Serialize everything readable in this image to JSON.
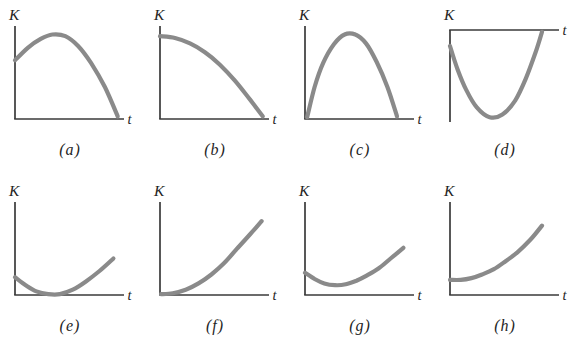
{
  "figure": {
    "name": "eight-kinetic-energy-versus-time-graphs",
    "background_color": "#ffffff",
    "curve_color": "#8a8a8a",
    "axis_color": "#3a3a3a",
    "text_color": "#1f1f1f",
    "curve_stroke_width": 4.2,
    "axis_stroke_width": 1.7
  },
  "chart_data": [
    {
      "id": "a",
      "type": "line",
      "caption": "(a)",
      "xlabel": "t",
      "ylabel": "K",
      "x_axis_position": "bottom",
      "x_range": [
        0,
        1
      ],
      "y_range": [
        0,
        1
      ],
      "grid": false,
      "points": [
        [
          0,
          0.66
        ],
        [
          0.12,
          0.8
        ],
        [
          0.24,
          0.9
        ],
        [
          0.35,
          0.95
        ],
        [
          0.47,
          0.93
        ],
        [
          0.59,
          0.82
        ],
        [
          0.71,
          0.63
        ],
        [
          0.84,
          0.36
        ],
        [
          0.96,
          0.03
        ]
      ]
    },
    {
      "id": "b",
      "type": "line",
      "caption": "(b)",
      "xlabel": "t",
      "ylabel": "K",
      "x_axis_position": "bottom",
      "x_range": [
        0,
        1
      ],
      "y_range": [
        0,
        1
      ],
      "grid": false,
      "points": [
        [
          0,
          0.93
        ],
        [
          0.14,
          0.91
        ],
        [
          0.28,
          0.85
        ],
        [
          0.42,
          0.75
        ],
        [
          0.56,
          0.61
        ],
        [
          0.7,
          0.43
        ],
        [
          0.84,
          0.22
        ],
        [
          0.96,
          0.03
        ]
      ]
    },
    {
      "id": "c",
      "type": "line",
      "caption": "(c)",
      "xlabel": "t",
      "ylabel": "K",
      "x_axis_position": "bottom",
      "x_range": [
        0,
        1
      ],
      "y_range": [
        0,
        1
      ],
      "grid": false,
      "points": [
        [
          0.02,
          0.02
        ],
        [
          0.09,
          0.36
        ],
        [
          0.17,
          0.63
        ],
        [
          0.27,
          0.84
        ],
        [
          0.37,
          0.95
        ],
        [
          0.47,
          0.95
        ],
        [
          0.57,
          0.85
        ],
        [
          0.67,
          0.64
        ],
        [
          0.77,
          0.36
        ],
        [
          0.86,
          0.03
        ]
      ]
    },
    {
      "id": "d",
      "type": "line",
      "caption": "(d)",
      "xlabel": "t",
      "ylabel": "K",
      "x_axis_position": "top",
      "x_range": [
        0,
        1
      ],
      "y_range": [
        0,
        1
      ],
      "grid": false,
      "points": [
        [
          0,
          0.18
        ],
        [
          0.07,
          0.44
        ],
        [
          0.15,
          0.67
        ],
        [
          0.25,
          0.87
        ],
        [
          0.37,
          0.98
        ],
        [
          0.49,
          0.95
        ],
        [
          0.61,
          0.79
        ],
        [
          0.71,
          0.54
        ],
        [
          0.8,
          0.25
        ],
        [
          0.86,
          0.02
        ]
      ]
    },
    {
      "id": "e",
      "type": "line",
      "caption": "(e)",
      "xlabel": "t",
      "ylabel": "K",
      "x_axis_position": "bottom",
      "x_range": [
        0,
        1
      ],
      "y_range": [
        0,
        1
      ],
      "grid": false,
      "points": [
        [
          0,
          0.2
        ],
        [
          0.1,
          0.11
        ],
        [
          0.2,
          0.04
        ],
        [
          0.31,
          0.01
        ],
        [
          0.42,
          0.01
        ],
        [
          0.54,
          0.06
        ],
        [
          0.66,
          0.15
        ],
        [
          0.79,
          0.27
        ],
        [
          0.92,
          0.41
        ]
      ]
    },
    {
      "id": "f",
      "type": "line",
      "caption": "(f)",
      "xlabel": "t",
      "ylabel": "K",
      "x_axis_position": "bottom",
      "x_range": [
        0,
        1
      ],
      "y_range": [
        0,
        1
      ],
      "grid": false,
      "points": [
        [
          0.01,
          0.01
        ],
        [
          0.12,
          0.02
        ],
        [
          0.24,
          0.06
        ],
        [
          0.36,
          0.13
        ],
        [
          0.48,
          0.23
        ],
        [
          0.6,
          0.36
        ],
        [
          0.72,
          0.52
        ],
        [
          0.84,
          0.68
        ],
        [
          0.95,
          0.83
        ]
      ]
    },
    {
      "id": "g",
      "type": "line",
      "caption": "(g)",
      "xlabel": "t",
      "ylabel": "K",
      "x_axis_position": "bottom",
      "x_range": [
        0,
        1
      ],
      "y_range": [
        0,
        1
      ],
      "grid": false,
      "points": [
        [
          0,
          0.25
        ],
        [
          0.09,
          0.18
        ],
        [
          0.18,
          0.13
        ],
        [
          0.28,
          0.11
        ],
        [
          0.38,
          0.12
        ],
        [
          0.48,
          0.16
        ],
        [
          0.58,
          0.22
        ],
        [
          0.69,
          0.3
        ],
        [
          0.8,
          0.41
        ],
        [
          0.92,
          0.53
        ]
      ]
    },
    {
      "id": "h",
      "type": "line",
      "caption": "(h)",
      "xlabel": "t",
      "ylabel": "K",
      "x_axis_position": "bottom",
      "x_range": [
        0,
        1
      ],
      "y_range": [
        0,
        1
      ],
      "grid": false,
      "points": [
        [
          0,
          0.17
        ],
        [
          0.1,
          0.17
        ],
        [
          0.2,
          0.19
        ],
        [
          0.3,
          0.23
        ],
        [
          0.41,
          0.29
        ],
        [
          0.52,
          0.38
        ],
        [
          0.63,
          0.48
        ],
        [
          0.75,
          0.62
        ],
        [
          0.86,
          0.78
        ]
      ]
    }
  ]
}
